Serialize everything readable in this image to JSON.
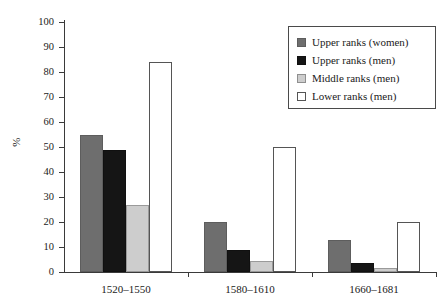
{
  "chart_data": {
    "type": "bar",
    "title": "",
    "subtitle": "",
    "xlabel": "",
    "ylabel": "%",
    "ylim": [
      0,
      100
    ],
    "ytick_step": 10,
    "yticks": [
      0,
      10,
      20,
      30,
      40,
      50,
      60,
      70,
      80,
      90,
      100
    ],
    "ytick_labels": [
      "0",
      "10",
      "20",
      "30",
      "40",
      "50",
      "60",
      "70",
      "80",
      "90",
      "100"
    ],
    "grid": false,
    "legend_position": "top-right",
    "categories": [
      "1520–1550",
      "1580–1610",
      "1660–1681"
    ],
    "series": [
      {
        "name": "Upper ranks (women)",
        "color": "#6e6e6e",
        "values": [
          55,
          20,
          13
        ]
      },
      {
        "name": "Upper ranks (men)",
        "color": "#151515",
        "values": [
          49,
          9,
          3.5
        ]
      },
      {
        "name": "Middle ranks (men)",
        "color": "#cdcdcd",
        "values": [
          27,
          4.5,
          1.5
        ]
      },
      {
        "name": "Lower ranks (men)",
        "color": "#ffffff",
        "values": [
          84,
          50,
          20
        ]
      }
    ]
  },
  "legend": {
    "entries": [
      {
        "label": "Upper ranks (women)",
        "swatch": "legend-swatch-upper-women"
      },
      {
        "label": "Upper ranks (men)",
        "swatch": "legend-swatch-upper-men"
      },
      {
        "label": "Middle ranks (men)",
        "swatch": "legend-swatch-middle-men"
      },
      {
        "label": "Lower ranks (men)",
        "swatch": "legend-swatch-lower-men"
      }
    ]
  },
  "axes": {
    "y_title": "%",
    "y_labels": [
      "100",
      "90",
      "80",
      "70",
      "60",
      "50",
      "40",
      "30",
      "20",
      "10",
      "0"
    ],
    "x_labels": [
      "1520–1550",
      "1580–1610",
      "1660–1681"
    ]
  },
  "colors": {
    "upper_women": "#6e6e6e",
    "upper_men": "#151515",
    "middle_men": "#cdcdcd",
    "lower_men": "#ffffff",
    "axis": "#3a3a3a",
    "text": "#1a1a1a"
  }
}
